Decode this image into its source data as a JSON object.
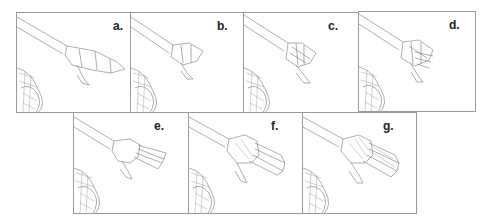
{
  "figure": {
    "panels": [
      {
        "id": "a",
        "label": "a.",
        "stage": 1,
        "fingers": 0
      },
      {
        "id": "b",
        "label": "b.",
        "stage": 2,
        "fingers": 1
      },
      {
        "id": "c",
        "label": "c.",
        "stage": 3,
        "fingers": 1
      },
      {
        "id": "d",
        "label": "d.",
        "stage": 4,
        "fingers": 3
      },
      {
        "id": "e",
        "label": "e.",
        "stage": 5,
        "fingers": 4
      },
      {
        "id": "f",
        "label": "f.",
        "stage": 6,
        "fingers": 4
      },
      {
        "id": "g",
        "label": "g.",
        "stage": 7,
        "fingers": 4
      }
    ]
  },
  "colors": {
    "border": "#9a9a9a",
    "wireframe": "#777777",
    "background": "#ffffff",
    "label": "#222222"
  }
}
